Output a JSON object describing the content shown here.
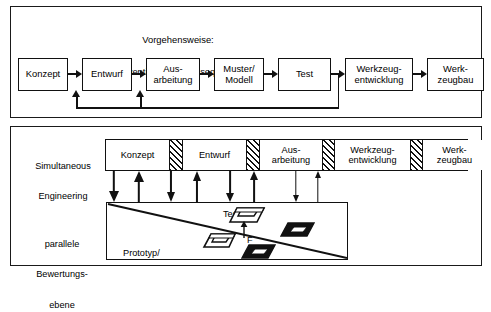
{
  "diagram": {
    "title_hidden": "",
    "top_panel": {
      "caption_line1": "Vorgehensweise:",
      "caption_line2": "Konventionell, linear, sequentiell",
      "boxes": [
        {
          "line1": "Konzept",
          "line2": ""
        },
        {
          "line1": "Entwurf",
          "line2": ""
        },
        {
          "line1": "Aus-",
          "line2": "arbeitung"
        },
        {
          "line1": "Muster/",
          "line2": "Modell"
        },
        {
          "line1": "Test",
          "line2": ""
        },
        {
          "line1": "Werkzeug-",
          "line2": "entwicklung"
        },
        {
          "line1": "Werk-",
          "line2": "zeugbau"
        }
      ]
    },
    "bottom_panel": {
      "label_se_line1": "Simultaneous",
      "label_se_line2": "Engineering",
      "label_plane_line1": "parallele",
      "label_plane_line2": "Bewertungs-",
      "label_plane_line3": "ebene",
      "phases": [
        {
          "line1": "Konzept",
          "line2": ""
        },
        {
          "line1": "Entwurf",
          "line2": ""
        },
        {
          "line1": "Aus-",
          "line2": "arbeitung"
        },
        {
          "line1": "Werkzeug-",
          "line2": "entwicklung"
        },
        {
          "line1": "Werk-",
          "line2": "zeugbau"
        }
      ],
      "plane": {
        "prototyp_line1": "Prototyp/",
        "prototyp_line2": "Modell",
        "test_label": "Test",
        "force_label": "F"
      }
    },
    "colors": {
      "line": "#111111",
      "background": "#ffffff",
      "fill_dark": "#1a1a1a"
    }
  }
}
